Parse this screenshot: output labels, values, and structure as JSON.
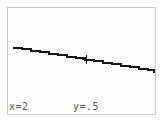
{
  "screen": {
    "device": "graphing-calculator",
    "background_color": "#ffffff",
    "border_color": "#c9c9cc",
    "trace_color": "#151515",
    "text_color": "#55555a"
  },
  "status": {
    "x_readout": "x=2",
    "y_readout": "y=.5"
  },
  "cursor": {
    "glyph": "+",
    "x_px": 78,
    "y_px": 51
  },
  "chart_data": {
    "type": "line",
    "title": "",
    "xlabel": "",
    "ylabel": "",
    "grid": false,
    "legend": null,
    "axis_visible": false,
    "traced_point": {
      "x": 2,
      "y": 0.5
    },
    "xlim": [
      -4.7,
      4.7
    ],
    "ylim": [
      -3.1,
      3.1
    ],
    "series": [
      {
        "name": "Y1",
        "style": "stepped-pixel-line",
        "x": [
          -4.7,
          -3.6,
          -2.5,
          -1.4,
          -0.3,
          0.8,
          1.9,
          3.0,
          4.1,
          4.7
        ],
        "y": [
          1.14,
          0.95,
          0.76,
          0.57,
          0.38,
          0.19,
          0.0,
          -0.19,
          -0.38,
          -0.48
        ],
        "points_px": [
          [
            5,
            39
          ],
          [
            14,
            40
          ],
          [
            23,
            42
          ],
          [
            32,
            43
          ],
          [
            41,
            45
          ],
          [
            50,
            46
          ],
          [
            59,
            48
          ],
          [
            68,
            49
          ],
          [
            77,
            51
          ],
          [
            86,
            52
          ],
          [
            95,
            54
          ],
          [
            104,
            55
          ],
          [
            113,
            57
          ],
          [
            122,
            58
          ],
          [
            131,
            60
          ],
          [
            140,
            61
          ],
          [
            146,
            63
          ]
        ]
      }
    ]
  }
}
